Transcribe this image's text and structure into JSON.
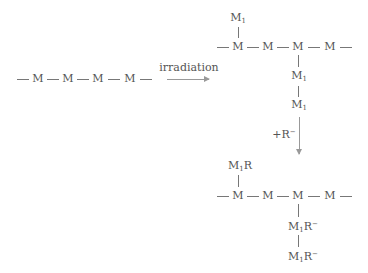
{
  "diagram": {
    "type": "reaction-scheme",
    "start": {
      "chain_units": [
        "M",
        "M",
        "M",
        "M"
      ]
    },
    "step1": {
      "arrow_label": "irradiation",
      "product": {
        "chain_units": [
          "M",
          "M",
          "M",
          "M"
        ],
        "branch_up": {
          "on_unit": 1,
          "label": "M",
          "sub": "1"
        },
        "branch_down": {
          "on_unit": 3,
          "labels": [
            {
              "label": "M",
              "sub": "1"
            },
            {
              "label": "M",
              "sub": "1"
            }
          ]
        }
      }
    },
    "step2": {
      "arrow_label_prefix": "+R",
      "arrow_label_sup": "−",
      "product": {
        "chain_units": [
          "M",
          "M",
          "M",
          "M"
        ],
        "branch_up": {
          "on_unit": 1,
          "label": "M",
          "sub": "1",
          "suffix": "R"
        },
        "branch_down": {
          "on_unit": 3,
          "labels": [
            {
              "label": "M",
              "sub": "1",
              "suffix": "R",
              "sup": "−"
            },
            {
              "label": "M",
              "sub": "1",
              "suffix": "R",
              "sup": "−"
            }
          ]
        }
      }
    }
  }
}
